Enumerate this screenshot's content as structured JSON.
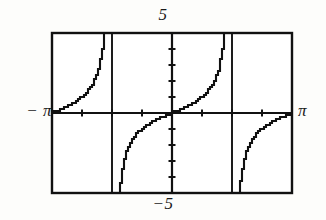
{
  "figure": {
    "kind": "graphing-calculator-plot",
    "background_color": "#fdfdfb",
    "ink_color": "#111111"
  },
  "labels": {
    "top": "5",
    "bottom": "−5",
    "left": "− π",
    "right": "π"
  },
  "frame": {
    "left_px": 52,
    "top_px": 33,
    "right_px": 292,
    "bottom_px": 193,
    "border_width_px": 2
  },
  "chart_data": {
    "type": "line",
    "title": "",
    "subtitle": "",
    "xlabel": "",
    "ylabel": "",
    "function": "y = tan(x)",
    "xlim": [
      -3.14159265,
      3.14159265
    ],
    "ylim": [
      -5,
      5
    ],
    "xtick_labels": [
      "− π",
      "π"
    ],
    "ytick_labels": [
      "5",
      "−5"
    ],
    "x_axis_tick_values": [
      -2.3562,
      -1.5708,
      -0.7854,
      0.7854,
      1.5708,
      2.3562
    ],
    "y_axis_tick_values": [
      -4,
      -3,
      -2,
      -1,
      1,
      2,
      3,
      4
    ],
    "grid": false,
    "legend": null,
    "axes_drawn": [
      "x-axis at y=0",
      "y-axis at x=0"
    ],
    "asymptotes": [
      -1.5707963,
      1.5707963
    ],
    "asymptote_style": "solid vertical line",
    "render_style": "pixelated stair-step (calculator screen)",
    "branches": [
      {
        "name": "branch-left-rising",
        "x_range": [
          -3.14159265,
          -1.5707963
        ],
        "y_range": [
          0,
          5
        ],
        "description": "rises from y=0 at x=-pi to +infinity at x=-pi/2"
      },
      {
        "name": "branch-midleft-rising",
        "x_range": [
          -1.5707963,
          0
        ],
        "y_range": [
          -5,
          0
        ],
        "description": "rises from -infinity at x=-pi/2 to y=0 at x=0"
      },
      {
        "name": "branch-midright-rising",
        "x_range": [
          0,
          1.5707963
        ],
        "y_range": [
          0,
          5
        ],
        "description": "rises from y=0 at x=0 to +infinity at x=pi/2"
      },
      {
        "name": "branch-right-rising",
        "x_range": [
          1.5707963,
          3.14159265
        ],
        "y_range": [
          -5,
          0
        ],
        "description": "rises from -infinity at x=pi/2 to y=0 at x=pi"
      }
    ],
    "series": [
      {
        "name": "tan(x)",
        "x": [
          -3.1416,
          -3.0,
          -2.85,
          -2.7,
          -2.55,
          -2.4,
          -2.25,
          -2.1,
          -1.95,
          -1.85,
          -1.78,
          -1.72,
          -1.68,
          -1.65,
          -1.63,
          -1.61,
          -1.53,
          -1.51,
          -1.49,
          -1.46,
          -1.43,
          -1.39,
          -1.34,
          -1.28,
          -1.2,
          -1.1,
          -0.95,
          -0.8,
          -0.65,
          -0.5,
          -0.35,
          -0.2,
          0,
          0.2,
          0.35,
          0.5,
          0.65,
          0.8,
          0.95,
          1.1,
          1.2,
          1.28,
          1.34,
          1.39,
          1.43,
          1.46,
          1.49,
          1.51,
          1.53,
          1.61,
          1.63,
          1.65,
          1.68,
          1.72,
          1.78,
          1.85,
          1.95,
          2.1,
          2.25,
          2.4,
          2.55,
          2.7,
          2.85,
          3.0,
          3.1416
        ],
        "y": [
          0.0,
          0.1425,
          0.2936,
          0.4577,
          0.6431,
          0.8637,
          1.1504,
          1.7098,
          2.6855,
          3.8513,
          5.0,
          -5.0,
          -3.8,
          -2.9,
          -2.5,
          -2.2,
          -24.5,
          -5.0,
          -4.0,
          -2.2,
          -1.7,
          -1.3,
          -0.98,
          -0.73,
          -0.55,
          -0.41,
          -0.3,
          -0.22,
          -0.15,
          -0.1,
          -0.055,
          -0.02,
          0.0,
          0.02,
          0.055,
          0.1,
          0.15,
          0.22,
          0.3,
          0.41,
          0.55,
          0.73,
          0.98,
          1.3,
          1.7,
          2.2,
          4.0,
          5.0,
          24.5,
          2.2,
          2.5,
          2.9,
          3.8,
          5.0,
          -5.0,
          -3.85,
          -2.69,
          -1.71,
          -1.15,
          -0.86,
          -0.64,
          -0.46,
          -0.29,
          -0.14,
          0.0
        ]
      }
    ]
  }
}
